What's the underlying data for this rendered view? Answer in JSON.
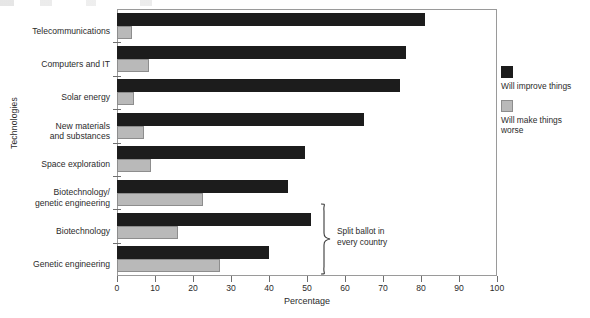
{
  "chart_data": {
    "type": "bar",
    "orientation": "horizontal",
    "title": "",
    "xlabel": "Percentage",
    "ylabel": "Technologies",
    "xlim": [
      0,
      100
    ],
    "xticks": [
      0,
      10,
      20,
      30,
      40,
      50,
      60,
      70,
      80,
      90,
      100
    ],
    "grid": false,
    "legend_position": "right",
    "categories": [
      "Telecommunications",
      "Computers and IT",
      "Solar energy",
      "New materials\nand substances",
      "Space exploration",
      "Biotechnology/\ngenetic engineering",
      "Biotechnology",
      "Genetic engineering"
    ],
    "series": [
      {
        "name": "Will improve things",
        "color": "#1c1c1c",
        "values": [
          81,
          76,
          74.5,
          65,
          49.5,
          45,
          51,
          40
        ]
      },
      {
        "name": "Will make things\nworse",
        "color": "#b9b9b9",
        "values": [
          4,
          8.5,
          4.5,
          7,
          9,
          22.5,
          16,
          27
        ]
      }
    ],
    "annotations": [
      {
        "name": "split-ballot",
        "text": "Split ballot in\nevery country",
        "applies_to": [
          "Biotechnology",
          "Genetic engineering"
        ]
      }
    ]
  },
  "legend": {
    "entries": [
      {
        "label": "Will improve things",
        "swatch": "dark-square-swatch"
      },
      {
        "label": "Will make things\nworse",
        "swatch": "light-square-swatch"
      }
    ]
  },
  "axes": {
    "x_title": "Percentage",
    "y_title": "Technologies",
    "x_tick_labels": [
      "0",
      "10",
      "20",
      "30",
      "40",
      "50",
      "60",
      "70",
      "80",
      "90",
      "100"
    ]
  },
  "colors": {
    "series_improve": "#1c1c1c",
    "series_worse": "#b9b9b9",
    "axis": "#6e6e6e",
    "frame": "#9a9a9a",
    "text": "#2b2b2b",
    "background": "#ffffff"
  }
}
